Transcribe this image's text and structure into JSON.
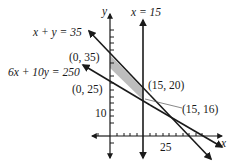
{
  "diagram": {
    "type": "linear-programming-feasible-region",
    "axes": {
      "x_label": "x",
      "y_label": "y",
      "x_tick_label": "25",
      "y_tick_label": "10"
    },
    "lines": [
      {
        "id": "vertical",
        "label": "x = 15"
      },
      {
        "id": "line1",
        "label": "x + y = 35"
      },
      {
        "id": "line2",
        "label": "6x + 10y = 250"
      }
    ],
    "vertices": [
      {
        "label": "(0, 35)",
        "x": 0,
        "y": 35
      },
      {
        "label": "(0, 25)",
        "x": 0,
        "y": 25
      },
      {
        "label": "(15, 20)",
        "x": 15,
        "y": 20
      },
      {
        "label": "(15, 16)",
        "x": 15,
        "y": 16
      }
    ],
    "colors": {
      "line": "#1a1a1a",
      "shade": "#bdbdbd",
      "leader": "#555555"
    }
  }
}
